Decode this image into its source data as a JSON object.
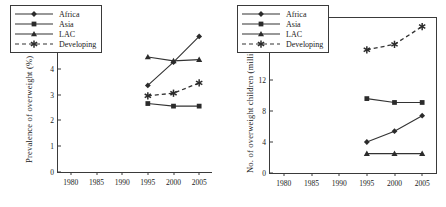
{
  "figure": {
    "panels": [
      "left",
      "right"
    ],
    "series_colors": {
      "line": "#333333",
      "marker": "#2b2b2b"
    }
  },
  "chart_data": [
    {
      "id": "left",
      "type": "line",
      "title": "",
      "xlabel": "",
      "ylabel": "Prevalence of overweight (%)",
      "xlim": [
        1977.5,
        2007.5
      ],
      "ylim": [
        0,
        6
      ],
      "yticks": [
        0,
        1,
        2,
        3,
        4,
        5,
        6
      ],
      "xticks": [
        1980,
        1985,
        1990,
        1995,
        2000,
        2005
      ],
      "grid": false,
      "legend_position": "upper-left",
      "x": [
        1995,
        2000,
        2005
      ],
      "series": [
        {
          "name": "Africa",
          "marker": "diamond",
          "linestyle": "solid",
          "values": [
            3.35,
            4.25,
            5.25
          ]
        },
        {
          "name": "Asia",
          "marker": "square",
          "linestyle": "solid",
          "values": [
            2.65,
            2.55,
            2.55
          ]
        },
        {
          "name": "LAC",
          "marker": "triangle",
          "linestyle": "solid",
          "values": [
            4.45,
            4.3,
            4.35
          ]
        },
        {
          "name": "Developing",
          "marker": "asterisk",
          "linestyle": "dashed",
          "values": [
            2.95,
            3.05,
            3.45
          ]
        }
      ]
    },
    {
      "id": "right",
      "type": "line",
      "title": "",
      "xlabel": "",
      "ylabel": "No. of overweight children (million)",
      "xlim": [
        1977.5,
        2007.5
      ],
      "ylim": [
        0,
        20
      ],
      "yticks": [
        0,
        4,
        8,
        12,
        16,
        20
      ],
      "xticks": [
        1980,
        1985,
        1990,
        1995,
        2000,
        2005
      ],
      "grid": false,
      "legend_position": "upper-left",
      "x": [
        1995,
        2000,
        2005
      ],
      "series": [
        {
          "name": "Africa",
          "marker": "diamond",
          "linestyle": "solid",
          "values": [
            4.0,
            5.4,
            7.4
          ]
        },
        {
          "name": "Asia",
          "marker": "square",
          "linestyle": "solid",
          "values": [
            9.6,
            9.1,
            9.1
          ]
        },
        {
          "name": "LAC",
          "marker": "triangle",
          "linestyle": "solid",
          "values": [
            2.5,
            2.5,
            2.5
          ]
        },
        {
          "name": "Developing",
          "marker": "asterisk",
          "linestyle": "dashed",
          "values": [
            15.9,
            16.6,
            18.9
          ]
        }
      ]
    }
  ]
}
